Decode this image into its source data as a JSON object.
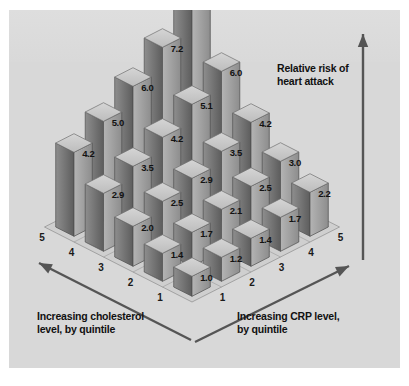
{
  "figure": {
    "background_color": "#d8d8d8",
    "border_color": "#ffffff"
  },
  "labels": {
    "vertical_axis": "Relative risk of\nheart attack",
    "vertical_axis_line1": "Relative risk of",
    "vertical_axis_line2": "heart attack",
    "left_axis_line1": "Increasing cholesterol",
    "left_axis_line2": "level, by quintile",
    "right_axis_line1": "Increasing CRP level,",
    "right_axis_line2": "by quintile"
  },
  "ticks": {
    "cholesterol": [
      "1",
      "2",
      "3",
      "4",
      "5"
    ],
    "crp": [
      "1",
      "2",
      "3",
      "4",
      "5"
    ]
  },
  "colors": {
    "bar_top": "#c9c9c9",
    "bar_left": "#6e6e6e",
    "bar_right": "#9c9c9c",
    "floor": "#cfcfcf",
    "grid_line": "#8a8a8a",
    "arrow": "#555555",
    "text": "#121212"
  },
  "chart_data": {
    "type": "bar",
    "title": "Relative risk of heart attack",
    "subtitle": "",
    "xlabel": "Increasing CRP level, by quintile",
    "ylabel": "Increasing cholesterol level, by quintile",
    "zlabel": "Relative risk of heart attack",
    "three_d": true,
    "grid": true,
    "legend": "none",
    "x_categories": [
      "1",
      "2",
      "3",
      "4",
      "5"
    ],
    "y_categories": [
      "1",
      "2",
      "3",
      "4",
      "5"
    ],
    "zlim": [
      0,
      8.7
    ],
    "matrix_note": "rows = cholesterol quintile 1..5 (front to back), columns = CRP quintile 1..5 (left to right)",
    "series": [
      {
        "name": "Cholesterol quintile 1",
        "values": [
          1.0,
          1.2,
          1.4,
          1.7,
          2.2
        ]
      },
      {
        "name": "Cholesterol quintile 2",
        "values": [
          1.4,
          1.7,
          2.1,
          2.5,
          3.0
        ]
      },
      {
        "name": "Cholesterol quintile 3",
        "values": [
          2.0,
          2.5,
          2.9,
          3.5,
          4.2
        ]
      },
      {
        "name": "Cholesterol quintile 4",
        "values": [
          2.9,
          3.5,
          4.2,
          5.1,
          6.0
        ]
      },
      {
        "name": "Cholesterol quintile 5",
        "values": [
          4.2,
          5.0,
          6.0,
          7.2,
          8.7
        ]
      }
    ],
    "data_labels": [
      [
        "1.0",
        "1.2",
        "1.4",
        "1.7",
        "2.2"
      ],
      [
        "1.4",
        "1.7",
        "2.1",
        "2.5",
        "3.0"
      ],
      [
        "2.0",
        "2.5",
        "2.9",
        "3.5",
        "4.2"
      ],
      [
        "2.9",
        "3.5",
        "4.2",
        "5.1",
        "6.0"
      ],
      [
        "4.2",
        "5.0",
        "6.0",
        "7.2",
        "8.7"
      ]
    ]
  }
}
